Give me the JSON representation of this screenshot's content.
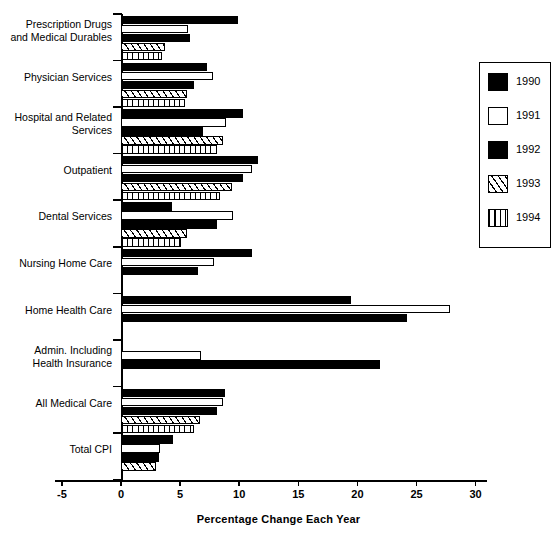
{
  "chart_data": {
    "type": "bar",
    "orientation": "horizontal",
    "title": "",
    "xlabel": "Percentage Change Each Year",
    "ylabel": "",
    "xlim": [
      -5,
      30
    ],
    "xticks": [
      -5,
      0,
      5,
      10,
      15,
      20,
      25,
      30
    ],
    "xtick_labels": [
      "-5",
      "0",
      "5",
      "10",
      "15",
      "20",
      "25",
      "30"
    ],
    "grid": false,
    "legend_position": "right",
    "categories": [
      "Prescription Drugs\nand Medical Durables",
      "Physician Services",
      "Hospital and Related\nServices",
      "Outpatient",
      "Dental Services",
      "Nursing Home Care",
      "Home Health Care",
      "Admin. Including\nHealth Insurance",
      "All Medical Care",
      "Total CPI"
    ],
    "series": [
      {
        "name": "1990",
        "fill": "solid-black",
        "values": [
          9.9,
          7.3,
          10.3,
          11.6,
          4.3,
          11.1,
          19.5,
          0.0,
          8.8,
          4.4
        ]
      },
      {
        "name": "1991",
        "fill": "white-outline",
        "values": [
          5.7,
          7.8,
          8.9,
          11.1,
          9.5,
          7.9,
          27.8,
          6.8,
          8.6,
          3.3
        ]
      },
      {
        "name": "1992",
        "fill": "solid-black",
        "values": [
          5.8,
          6.2,
          6.9,
          10.3,
          8.1,
          6.5,
          24.2,
          21.9,
          8.1,
          3.2
        ]
      },
      {
        "name": "1993",
        "fill": "diagonal-hatch",
        "values": [
          3.7,
          5.6,
          8.6,
          9.4,
          5.6,
          0.0,
          0.0,
          0.0,
          6.7,
          3.0
        ]
      },
      {
        "name": "1994",
        "fill": "vertical-hatch",
        "values": [
          3.5,
          5.4,
          8.1,
          8.4,
          5.1,
          0.0,
          0.0,
          0.0,
          6.2,
          0.0
        ]
      }
    ]
  },
  "legend": {
    "entries": [
      {
        "label": "1990"
      },
      {
        "label": "1991"
      },
      {
        "label": "1992"
      },
      {
        "label": "1993"
      },
      {
        "label": "1994"
      }
    ]
  },
  "colors": {
    "ink": "#000000",
    "paper": "#ffffff"
  }
}
